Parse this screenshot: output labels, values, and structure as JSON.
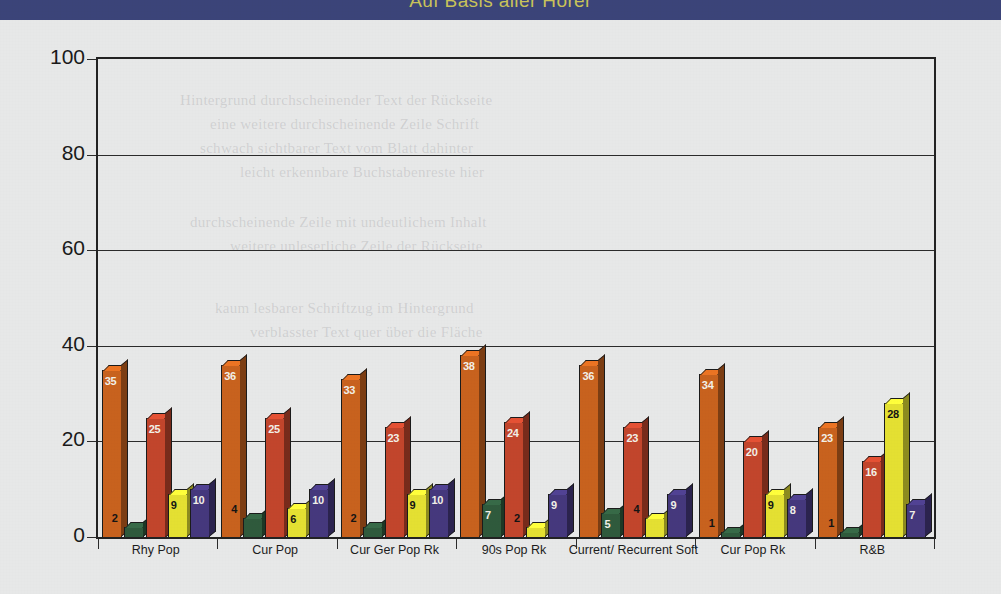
{
  "header": {
    "title": "Auf Basis aller Hörer",
    "band_color": "#3b4479",
    "title_color": "#c9c35a"
  },
  "ghost_text": [
    {
      "text": "Hintergrund durchscheinender Text der Rückseite",
      "x": 180,
      "y": 92
    },
    {
      "text": "eine weitere durchscheinende Zeile Schrift",
      "x": 210,
      "y": 116
    },
    {
      "text": "schwach sichtbarer Text vom Blatt dahinter",
      "x": 200,
      "y": 140
    },
    {
      "text": "leicht erkennbare Buchstabenreste hier",
      "x": 240,
      "y": 164
    },
    {
      "text": "durchscheinende Zeile mit undeutlichem Inhalt",
      "x": 190,
      "y": 214
    },
    {
      "text": "weitere unleserliche Zeile der Rückseite",
      "x": 230,
      "y": 238
    },
    {
      "text": "kaum lesbarer Schriftzug im Hintergrund",
      "x": 215,
      "y": 300
    },
    {
      "text": "verblasster Text quer über die Fläche",
      "x": 250,
      "y": 324
    }
  ],
  "chart_data": {
    "type": "bar",
    "title": "Auf Basis aller Hörer",
    "xlabel": "",
    "ylabel": "",
    "ylim": [
      0,
      100
    ],
    "yticks": [
      0,
      20,
      40,
      60,
      80,
      100
    ],
    "grid": true,
    "legend_position": "none",
    "categories": [
      "Rhy Pop",
      "Cur Pop",
      "Cur Ger Pop Rk",
      "90s Pop Rk",
      "Current/ Recurrent Soft",
      "Cur Pop Rk",
      "R&B"
    ],
    "series": [
      {
        "name": "series-1",
        "color": "#c8621e",
        "values": [
          35,
          36,
          33,
          38,
          36,
          34,
          23
        ]
      },
      {
        "name": "series-2",
        "color": "#2f5a3c",
        "values": [
          2,
          4,
          2,
          7,
          5,
          1,
          1
        ]
      },
      {
        "name": "series-3",
        "color": "#c2452c",
        "values": [
          25,
          25,
          23,
          24,
          23,
          20,
          16
        ]
      },
      {
        "name": "series-4",
        "color": "#e4e032",
        "values": [
          9,
          6,
          9,
          2,
          4,
          9,
          28
        ]
      },
      {
        "name": "series-5",
        "color": "#45387d",
        "values": [
          10,
          10,
          10,
          9,
          9,
          8,
          7
        ]
      }
    ]
  }
}
